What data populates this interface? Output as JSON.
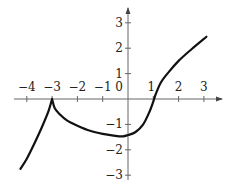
{
  "chart_data": {
    "type": "line",
    "title": "",
    "xlabel": "",
    "ylabel": "",
    "xlim": [
      -4.3,
      3.5
    ],
    "ylim": [
      -3.2,
      3.5
    ],
    "grid": false,
    "legend": null,
    "x_ticks": [
      -4,
      -3,
      -2,
      -1,
      0,
      1,
      2,
      3
    ],
    "x_tick_labels": [
      "−4",
      "−3",
      "−2",
      "−1",
      "0",
      "1",
      "2",
      "3"
    ],
    "y_ticks": [
      3,
      2,
      1,
      -1,
      -2,
      -3
    ],
    "y_tick_labels": [
      "3",
      "2",
      "1",
      "−1",
      "−2",
      "−3"
    ],
    "series": [
      {
        "name": "f(x)",
        "color": "#111111",
        "points": [
          [
            -4.25,
            -2.75
          ],
          [
            -4.0,
            -2.35
          ],
          [
            -3.7,
            -1.75
          ],
          [
            -3.4,
            -1.1
          ],
          [
            -3.15,
            -0.5
          ],
          [
            -3.0,
            0.0
          ],
          [
            -2.9,
            -0.35
          ],
          [
            -2.7,
            -0.6
          ],
          [
            -2.4,
            -0.85
          ],
          [
            -2.0,
            -1.05
          ],
          [
            -1.5,
            -1.25
          ],
          [
            -1.0,
            -1.37
          ],
          [
            -0.5,
            -1.45
          ],
          [
            -0.2,
            -1.47
          ],
          [
            0.0,
            -1.42
          ],
          [
            0.3,
            -1.3
          ],
          [
            0.6,
            -1.0
          ],
          [
            0.85,
            -0.5
          ],
          [
            1.0,
            -0.1
          ],
          [
            1.1,
            0.2
          ],
          [
            1.3,
            0.65
          ],
          [
            1.6,
            1.05
          ],
          [
            2.0,
            1.5
          ],
          [
            2.5,
            1.95
          ],
          [
            3.1,
            2.45
          ]
        ]
      }
    ],
    "annotations": [
      "cusp at (-3, 0)"
    ]
  }
}
